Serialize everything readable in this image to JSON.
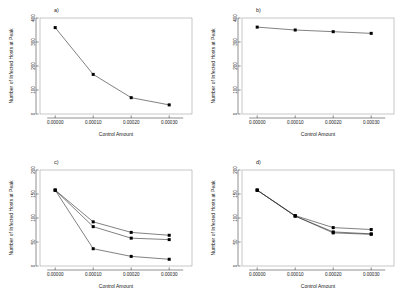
{
  "figure": {
    "background": "#ffffff",
    "axis_color": "#333333",
    "box_color": "#9a9a9a",
    "line_color": "#2b2b2b",
    "marker_color": "#000000",
    "panel_count": 4
  },
  "chart_data": [
    {
      "type": "line",
      "panel": "a)",
      "title": "",
      "xlabel": "Control Amount",
      "ylabel": "Number of Infected Hosts at Peak",
      "x": [
        0.0,
        0.0001,
        0.0002,
        0.0003
      ],
      "xticklabels": [
        "0.00000",
        "0.00010",
        "0.00020",
        "0.00030"
      ],
      "yticks": [
        0,
        100,
        200,
        300,
        400
      ],
      "yticklabels": [
        "0",
        "100",
        "200",
        "300",
        "400"
      ],
      "xlim": [
        -4e-05,
        0.00036
      ],
      "ylim": [
        0,
        400
      ],
      "grid": false,
      "legend": "none",
      "series": [
        {
          "name": "series-1",
          "values": [
            360,
            165,
            68,
            38
          ]
        }
      ]
    },
    {
      "type": "line",
      "panel": "b)",
      "title": "",
      "xlabel": "Control Amount",
      "ylabel": "Number of Infected Hosts at Peak",
      "x": [
        0.0,
        0.0001,
        0.0002,
        0.0003
      ],
      "xticklabels": [
        "0.00000",
        "0.00010",
        "0.00020",
        "0.00030"
      ],
      "yticks": [
        0,
        100,
        200,
        300,
        400
      ],
      "yticklabels": [
        "0",
        "100",
        "200",
        "300",
        "400"
      ],
      "xlim": [
        -4e-05,
        0.00036
      ],
      "ylim": [
        0,
        400
      ],
      "grid": false,
      "legend": "none",
      "series": [
        {
          "name": "series-1",
          "values": [
            362,
            350,
            343,
            336
          ]
        }
      ]
    },
    {
      "type": "line",
      "panel": "c)",
      "title": "",
      "xlabel": "Control Amount",
      "ylabel": "Number of Infected Hosts at Peak",
      "x": [
        0.0,
        0.0001,
        0.0002,
        0.0003
      ],
      "xticklabels": [
        "0.00000",
        "0.00010",
        "0.00020",
        "0.00030"
      ],
      "yticks": [
        0,
        50,
        100,
        150,
        200
      ],
      "yticklabels": [
        "0",
        "50",
        "100",
        "150",
        "200"
      ],
      "xlim": [
        -4e-05,
        0.00036
      ],
      "ylim": [
        0,
        200
      ],
      "grid": false,
      "legend": "none",
      "series": [
        {
          "name": "series-1",
          "values": [
            158,
            92,
            70,
            64
          ]
        },
        {
          "name": "series-2",
          "values": [
            158,
            82,
            58,
            55
          ]
        },
        {
          "name": "series-3",
          "values": [
            158,
            36,
            20,
            14
          ]
        }
      ]
    },
    {
      "type": "line",
      "panel": "d)",
      "title": "",
      "xlabel": "Control Amount",
      "ylabel": "Number of Infected Hosts at Peak",
      "x": [
        0.0,
        0.0001,
        0.0002,
        0.0003
      ],
      "xticklabels": [
        "0.00000",
        "0.00010",
        "0.00020",
        "0.00030"
      ],
      "yticks": [
        0,
        50,
        100,
        150,
        200
      ],
      "yticklabels": [
        "0",
        "50",
        "100",
        "150",
        "200"
      ],
      "xlim": [
        -4e-05,
        0.00036
      ],
      "ylim": [
        0,
        200
      ],
      "grid": false,
      "legend": "none",
      "series": [
        {
          "name": "series-1",
          "values": [
            158,
            105,
            80,
            76
          ]
        },
        {
          "name": "series-2",
          "values": [
            158,
            104,
            71,
            67
          ]
        },
        {
          "name": "series-3",
          "values": [
            158,
            104,
            69,
            66
          ]
        }
      ]
    }
  ]
}
